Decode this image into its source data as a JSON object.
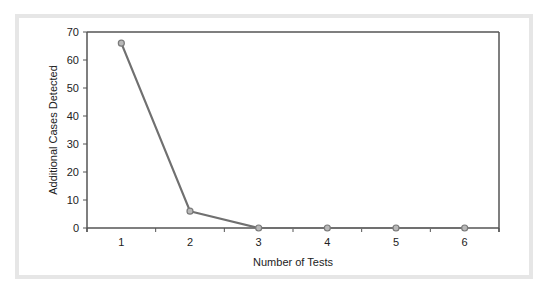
{
  "chart_data": {
    "type": "line",
    "title": "",
    "xlabel": "Number of Tests",
    "ylabel": "Additional Cases Detected",
    "x": [
      1,
      2,
      3,
      4,
      5,
      6
    ],
    "x_tick_labels": [
      "1",
      "2",
      "3",
      "4",
      "5",
      "6"
    ],
    "series": [
      {
        "name": "Additional Cases Detected",
        "values": [
          66,
          6,
          0,
          0,
          0,
          0
        ]
      }
    ],
    "xlim": [
      0.5,
      6.5
    ],
    "ylim": [
      0,
      70
    ],
    "y_ticks": [
      0,
      10,
      20,
      30,
      40,
      50,
      60,
      70
    ],
    "y_tick_labels": [
      "0",
      "10",
      "20",
      "30",
      "40",
      "50",
      "60",
      "70"
    ],
    "grid": false,
    "legend": "none",
    "colors": {
      "line": "#707070",
      "marker_stroke": "#7a7a7a",
      "marker_fill": "#b8b8b8",
      "axis": "#555555",
      "frame": "#e6e6e6"
    }
  }
}
